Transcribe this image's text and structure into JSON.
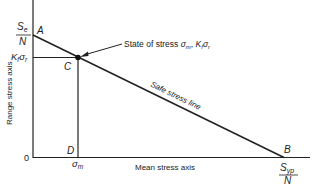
{
  "diagram": {
    "axes": {
      "y_label": "Range stress axis",
      "x_label": "Mean stress axis",
      "origin_label": "0"
    },
    "points": {
      "A": {
        "label": "A",
        "value_num": "S",
        "value_sub": "e",
        "value_den": "N"
      },
      "B": {
        "label": "B",
        "value_num": "S",
        "value_sub": "yp",
        "value_den": "N"
      },
      "C": {
        "label": "C"
      },
      "D": {
        "label": "D"
      }
    },
    "tick_labels": {
      "y_C": {
        "main": "K",
        "sub1": "f",
        "mid": "σ",
        "sub2": "r"
      },
      "x_D": {
        "main": "σ",
        "sub": "m"
      }
    },
    "line_label": "Safe stress line",
    "annotation": {
      "prefix": "State of stress ",
      "sigma": "σ",
      "sub_m": "m",
      "sep": ", ",
      "K": "K",
      "sub_f": "f",
      "sigma2": "σ",
      "sub_r": "r"
    },
    "colors": {
      "ink": "#222222",
      "background": "#ffffff"
    }
  }
}
